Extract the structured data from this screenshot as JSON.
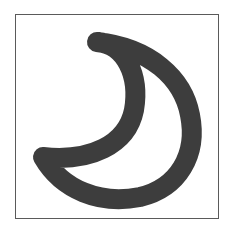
{
  "icon": {
    "name": "crescent-moon",
    "style": "outline",
    "stroke_color": "#3d3d3d",
    "stroke_width": 20
  },
  "frame": {
    "border_color": "#5a5a5a",
    "background": "#ffffff"
  }
}
